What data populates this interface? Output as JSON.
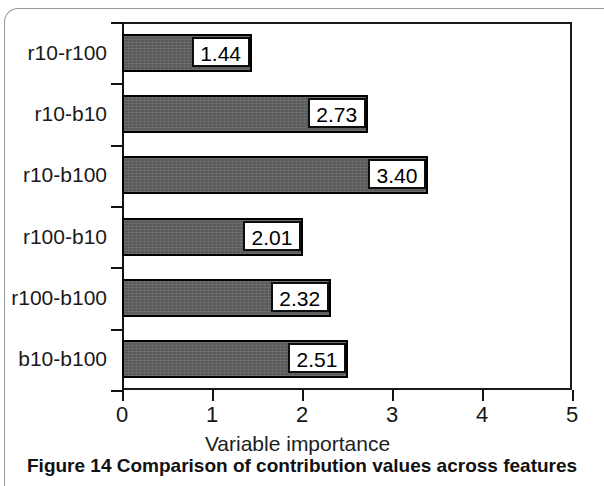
{
  "caption": {
    "prefix": "Figure 14",
    "text": "Comparison of contribution values across features"
  },
  "chart_data": {
    "type": "bar",
    "orientation": "horizontal",
    "title": "",
    "xlabel": "Variable importance",
    "ylabel": "",
    "xlim": [
      0,
      5
    ],
    "xticks": [
      "0",
      "1",
      "2",
      "3",
      "4",
      "5"
    ],
    "grid": false,
    "legend": null,
    "bar_color": "#5a5a5a",
    "bar_edge_color": "#000000",
    "label_box_fill": "#ffffff",
    "label_box_border": "#0d0d0d",
    "categories": [
      "r10-r100",
      "r10-b10",
      "r10-b100",
      "r100-b10",
      "r100-b100",
      "b10-b100"
    ],
    "values": [
      1.44,
      2.73,
      3.4,
      2.01,
      2.32,
      2.51
    ],
    "value_labels": [
      "1.44",
      "2.73",
      "3.40",
      "2.01",
      "2.32",
      "2.51"
    ]
  }
}
